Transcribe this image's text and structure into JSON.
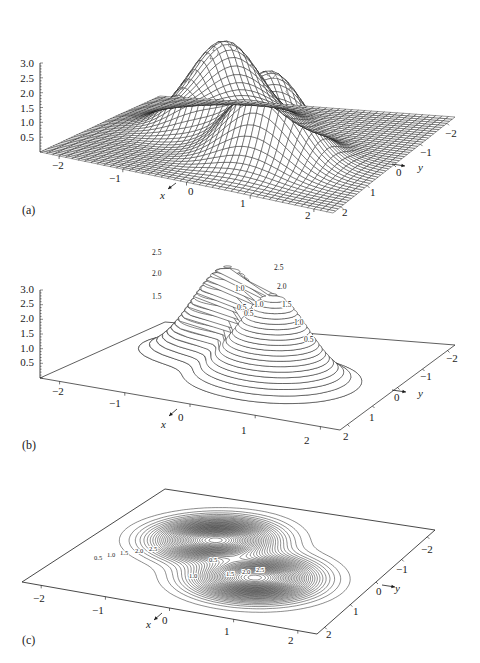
{
  "figure": {
    "panels": [
      {
        "id": "a",
        "label": "(a)",
        "style": "wireframe"
      },
      {
        "id": "b",
        "label": "(b)",
        "style": "3d-contour"
      },
      {
        "id": "c",
        "label": "(c)",
        "style": "planar-contour"
      }
    ],
    "axes": {
      "x_label": "x",
      "y_label": "y",
      "x_ticks": [
        "−2",
        "−1",
        "0",
        "1",
        "2"
      ],
      "y_ticks": [
        "−2",
        "−1",
        "0",
        "1",
        "2"
      ],
      "z_ticks": [
        "0.5",
        "1.0",
        "1.5",
        "2.0",
        "2.5",
        "3.0"
      ]
    },
    "contour_labels_b": [
      "2.5",
      "2.0",
      "1.5",
      "1.0",
      "0.5",
      "1.0",
      "0.5",
      "2.5",
      "2.0",
      "1.5",
      "1.0",
      "0.5"
    ],
    "contour_labels_c": [
      "0.5",
      "1.0",
      "1.5",
      "2.0",
      "2.5",
      "0.5",
      "1.0",
      "1.5",
      "2.0",
      "2.5"
    ],
    "line_color": "#1a1a1a"
  },
  "chart_data": [
    {
      "type": "surface",
      "panel": "(a)",
      "title": "",
      "render": "wireframe mesh",
      "xlabel": "x",
      "ylabel": "y",
      "zlabel": "",
      "x_range": [
        -2.3,
        2.3
      ],
      "y_range": [
        -2.3,
        2.3
      ],
      "zlim": [
        0,
        3.0
      ],
      "x_ticks": [
        -2,
        -1,
        0,
        1,
        2
      ],
      "y_ticks": [
        -2,
        -1,
        0,
        1,
        2
      ],
      "z_ticks": [
        0.5,
        1.0,
        1.5,
        2.0,
        2.5,
        3.0
      ],
      "description": "Two-peaked smooth surface (sum of two Gaussian bumps) with a saddle between them; both peaks reach roughly z≈3.0",
      "peaks": [
        {
          "x": -0.6,
          "y": -0.6,
          "z": 3.0
        },
        {
          "x": 0.6,
          "y": 0.6,
          "z": 3.0
        }
      ],
      "saddle": {
        "x": 0.0,
        "y": 0.0,
        "z": 0.3
      }
    },
    {
      "type": "contour3d",
      "panel": "(b)",
      "render": "contour lines drawn on the 3-D surface",
      "xlabel": "x",
      "ylabel": "y",
      "x_ticks": [
        -2,
        -1,
        0,
        1,
        2
      ],
      "y_ticks": [
        -2,
        -1,
        0,
        1,
        2
      ],
      "z_ticks": [
        0.5,
        1.0,
        1.5,
        2.0,
        2.5,
        3.0
      ],
      "zlim": [
        0,
        3.0
      ],
      "contour_levels_labeled": [
        0.5,
        1.0,
        1.5,
        2.0,
        2.5
      ]
    },
    {
      "type": "contour",
      "panel": "(c)",
      "render": "contour lines projected onto the xy-plane",
      "xlabel": "x",
      "ylabel": "y",
      "x_ticks": [
        -2,
        -1,
        0,
        1,
        2
      ],
      "y_ticks": [
        -2,
        -1,
        0,
        1,
        2
      ],
      "contour_levels_labeled": [
        0.5,
        1.0,
        1.5,
        2.0,
        2.5
      ]
    }
  ]
}
